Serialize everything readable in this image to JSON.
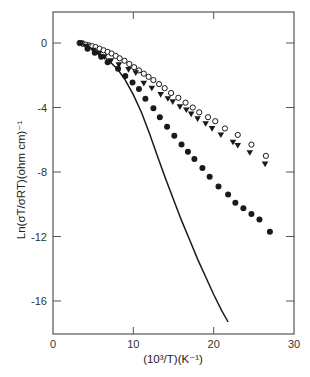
{
  "chart_data": {
    "type": "scatter",
    "title": "",
    "xlabel": "(10³/T)(K⁻¹)",
    "ylabel": "Ln(σT/σRT)(ohm cm)⁻¹",
    "xlim": [
      0,
      30
    ],
    "ylim": [
      -18,
      2
    ],
    "x_ticks": [
      0,
      10,
      20,
      30
    ],
    "y_ticks": [
      0,
      -4,
      -8,
      -12,
      -16
    ],
    "grid": false,
    "legend": null,
    "series": [
      {
        "name": "open circles",
        "marker": "open-circle",
        "points": [
          [
            3.3,
            0
          ],
          [
            3.7,
            -0.05
          ],
          [
            4.1,
            -0.1
          ],
          [
            4.5,
            -0.15
          ],
          [
            4.9,
            -0.2
          ],
          [
            5.3,
            -0.25
          ],
          [
            5.8,
            -0.35
          ],
          [
            6.3,
            -0.45
          ],
          [
            6.8,
            -0.55
          ],
          [
            7.3,
            -0.65
          ],
          [
            7.8,
            -0.8
          ],
          [
            8.3,
            -0.95
          ],
          [
            8.9,
            -1.1
          ],
          [
            9.5,
            -1.3
          ],
          [
            10.1,
            -1.5
          ],
          [
            10.7,
            -1.7
          ],
          [
            11.3,
            -1.9
          ],
          [
            11.9,
            -2.1
          ],
          [
            12.5,
            -2.3
          ],
          [
            13.2,
            -2.55
          ],
          [
            13.9,
            -2.8
          ],
          [
            14.7,
            -3.1
          ],
          [
            15.6,
            -3.4
          ],
          [
            16.5,
            -3.7
          ],
          [
            17.4,
            -4.0
          ],
          [
            18.2,
            -4.3
          ],
          [
            19.3,
            -4.6
          ],
          [
            20.2,
            -4.85
          ],
          [
            21.4,
            -5.3
          ],
          [
            23.0,
            -5.7
          ],
          [
            24.7,
            -6.3
          ],
          [
            26.5,
            -7.0
          ]
        ]
      },
      {
        "name": "filled triangles",
        "marker": "filled-triangle-down",
        "points": [
          [
            3.5,
            0
          ],
          [
            4.2,
            -0.2
          ],
          [
            5.0,
            -0.45
          ],
          [
            5.7,
            -0.65
          ],
          [
            6.4,
            -0.85
          ],
          [
            7.2,
            -1.1
          ],
          [
            8.2,
            -1.35
          ],
          [
            9.4,
            -1.65
          ],
          [
            10.3,
            -1.85
          ],
          [
            11.3,
            -2.5
          ],
          [
            12.3,
            -2.8
          ],
          [
            13.4,
            -3.2
          ],
          [
            14.3,
            -3.45
          ],
          [
            14.9,
            -3.65
          ],
          [
            15.8,
            -3.95
          ],
          [
            16.6,
            -4.15
          ],
          [
            17.2,
            -4.4
          ],
          [
            18.0,
            -4.7
          ],
          [
            19.0,
            -5.0
          ],
          [
            19.8,
            -5.3
          ],
          [
            20.9,
            -5.7
          ],
          [
            22.4,
            -6.15
          ],
          [
            23.0,
            -6.35
          ],
          [
            24.5,
            -6.8
          ],
          [
            26.4,
            -7.5
          ]
        ]
      },
      {
        "name": "filled circles",
        "marker": "filled-circle",
        "points": [
          [
            3.4,
            0
          ],
          [
            4.3,
            -0.35
          ],
          [
            5.2,
            -0.6
          ],
          [
            6.0,
            -0.85
          ],
          [
            6.8,
            -1.2
          ],
          [
            8.1,
            -1.6
          ],
          [
            9.0,
            -2.05
          ],
          [
            9.9,
            -2.45
          ],
          [
            10.7,
            -2.85
          ],
          [
            11.5,
            -3.45
          ],
          [
            12.5,
            -4.05
          ],
          [
            13.3,
            -4.6
          ],
          [
            14.2,
            -5.2
          ],
          [
            15.1,
            -5.75
          ],
          [
            16.0,
            -6.3
          ],
          [
            16.8,
            -6.75
          ],
          [
            17.6,
            -7.2
          ],
          [
            18.6,
            -7.75
          ],
          [
            19.5,
            -8.3
          ],
          [
            20.6,
            -8.9
          ],
          [
            21.8,
            -9.4
          ],
          [
            22.7,
            -9.9
          ],
          [
            23.7,
            -10.25
          ],
          [
            24.7,
            -10.6
          ],
          [
            25.7,
            -10.95
          ],
          [
            27.0,
            -11.7
          ]
        ]
      },
      {
        "name": "solid line",
        "marker": "line",
        "points": [
          [
            3.3,
            0
          ],
          [
            5.0,
            -0.4
          ],
          [
            6.5,
            -0.9
          ],
          [
            8.0,
            -1.6
          ],
          [
            9.0,
            -2.3
          ],
          [
            10.0,
            -3.2
          ],
          [
            11.0,
            -4.3
          ],
          [
            12.0,
            -5.6
          ],
          [
            13.0,
            -7.0
          ],
          [
            14.0,
            -8.4
          ],
          [
            15.0,
            -9.7
          ],
          [
            16.0,
            -11.0
          ],
          [
            17.0,
            -12.2
          ],
          [
            18.0,
            -13.4
          ],
          [
            19.0,
            -14.5
          ],
          [
            20.0,
            -15.6
          ],
          [
            21.0,
            -16.6
          ],
          [
            21.8,
            -17.3
          ]
        ]
      }
    ]
  },
  "axes": {
    "x_tick_labels": [
      "0",
      "10",
      "20",
      "30"
    ],
    "y_tick_labels": [
      "0",
      "-4",
      "-8",
      "-12",
      "-16"
    ],
    "x_title": "(10³/T)(K⁻¹)",
    "y_title": "Ln(σT/σRT)(ohm cm)⁻¹"
  },
  "style": {
    "ink": "#1a1a1a",
    "frame": "#555555",
    "background": "#ffffff"
  }
}
